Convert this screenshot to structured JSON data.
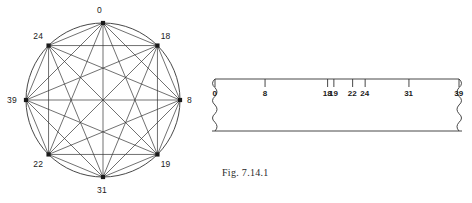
{
  "figure": {
    "caption": "Fig. 7.14.1",
    "type": "perfect-difference-set-diagram"
  },
  "graph": {
    "title": "",
    "vertex_count": 8,
    "edge_type": "complete-graph",
    "vertices": [
      {
        "label": "0",
        "angle_deg": 270,
        "position": "top"
      },
      {
        "label": "18",
        "angle_deg": 315,
        "position": "top-right"
      },
      {
        "label": "8",
        "angle_deg": 0,
        "position": "right"
      },
      {
        "label": "19",
        "angle_deg": 45,
        "position": "bottom-right"
      },
      {
        "label": "31",
        "angle_deg": 90,
        "position": "bottom"
      },
      {
        "label": "22",
        "angle_deg": 135,
        "position": "bottom-left"
      },
      {
        "label": "39",
        "angle_deg": 180,
        "position": "left"
      },
      {
        "label": "24",
        "angle_deg": 225,
        "position": "top-left"
      }
    ]
  },
  "ruler": {
    "min": 0,
    "max": 39,
    "ticks": [
      {
        "value": 0,
        "label": "0"
      },
      {
        "value": 8,
        "label": "8"
      },
      {
        "value": 18,
        "label": "18"
      },
      {
        "value": 19,
        "label": "19"
      },
      {
        "value": 22,
        "label": "22"
      },
      {
        "value": 24,
        "label": "24"
      },
      {
        "value": 31,
        "label": "31"
      },
      {
        "value": 39,
        "label": "39"
      }
    ],
    "torn_edges": [
      "left",
      "right"
    ]
  },
  "colors": {
    "ink": "#1a1a1a",
    "line": "#333333",
    "paper": "#ffffff"
  }
}
